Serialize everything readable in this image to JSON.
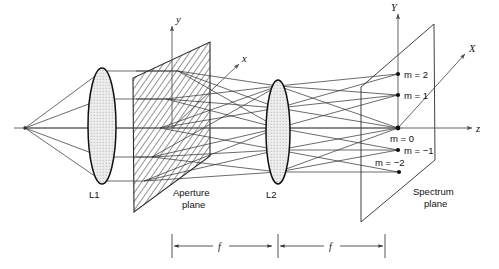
{
  "figure": {
    "background_color": "#ffffff",
    "ink_color": "#111111"
  },
  "labels": {
    "lens1": "L1",
    "lens2": "L2",
    "aperture_line1": "Aperture",
    "aperture_line2": "plane",
    "spectrum_line1": "Spectrum",
    "spectrum_line2": "plane"
  },
  "axes": {
    "y_small": "y",
    "x_small": "x",
    "z": "z",
    "Y_cap": "Y",
    "X_cap": "X"
  },
  "orders": [
    {
      "label_m": "m",
      "equals": "=",
      "value": "2",
      "text": "m = 2"
    },
    {
      "label_m": "m",
      "equals": "=",
      "value": "1",
      "text": "m = 1"
    },
    {
      "label_m": "m",
      "equals": "=",
      "value": "0",
      "text": "m = 0"
    },
    {
      "label_m": "m",
      "equals": "=",
      "value": "−1",
      "text": "m = −1"
    },
    {
      "label_m": "m",
      "equals": "=",
      "value": "−2",
      "text": "m = −2"
    }
  ],
  "dimensions": [
    {
      "name": "focal-length-1",
      "label": "f"
    },
    {
      "name": "focal-length-2",
      "label": "f"
    }
  ],
  "colors": {
    "lens_fill": "#e8e8e8",
    "hatch_stroke": "#3a3a3a",
    "ray_stroke": "#2b2b2b",
    "axis_stroke": "#555555"
  }
}
